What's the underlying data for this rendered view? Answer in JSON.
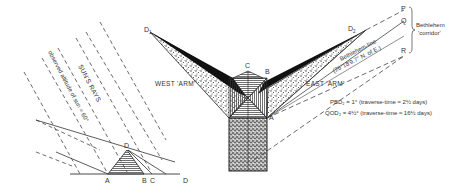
{
  "diagram": {
    "type": "geometric-illustration",
    "left_figure": {
      "rays_label": "SUN'S RAYS",
      "altitude_label": "observed altitude of sun = 60°",
      "points": [
        "A",
        "B",
        "C",
        "D",
        "D"
      ],
      "apex_label": "D",
      "base_labels": {
        "a": "A",
        "b": "B",
        "c": "C",
        "d": "D"
      }
    },
    "right_figure": {
      "point_d1": "D",
      "point_d1_sub": "1",
      "point_d2": "D",
      "point_d2_sub": "2",
      "point_c": "C",
      "point_b": "B",
      "point_a": "A",
      "west_arm": "WEST 'ARM'",
      "east_arm": "EAST 'ARM'",
      "p": "P",
      "q": "Q",
      "r": "R",
      "corridor_line1": "Bethlehem",
      "corridor_line2": "'corridor'",
      "bethlehem_line1": "Bethlehem-line",
      "bethlehem_line2": "(26°18'9.7\" N. of E.)"
    },
    "notes": [
      "PBD₂ = 1° (traverse-time ≈ 2½ days)",
      "QOD₂ = 4½° (traverse-time ≈ 16½ days)"
    ]
  }
}
